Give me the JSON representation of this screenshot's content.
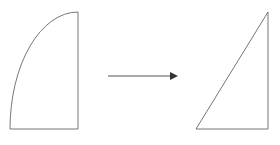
{
  "diagram": {
    "title": "Quarter ellipse region transformed into a right triangle",
    "background_color": "#ffffff",
    "stroke_color": "#777777",
    "arrow_color": "#444444",
    "canvas": {
      "width": 280,
      "height": 145
    }
  },
  "left_shape": {
    "name": "quarter-ellipse-region",
    "label": "",
    "description": "Region bounded by a concave-left elliptical arc, a vertical right edge and a horizontal bottom edge",
    "vertices": {
      "top_right": [
        78,
        12
      ],
      "bottom_right": [
        78,
        129
      ],
      "bottom_left": [
        10,
        129
      ]
    },
    "arc": {
      "type": "elliptical",
      "center": [
        78,
        129
      ],
      "rx": 68,
      "ry": 117,
      "from": [
        78,
        12
      ],
      "to": [
        10,
        129
      ],
      "sweep": "counterclockwise"
    },
    "path": "M 78 12 A 68 117 0 0 0 10 129 L 78 129 Z"
  },
  "right_shape": {
    "name": "right-triangle",
    "label": "",
    "description": "Right triangle with the right angle at the bottom-right corner",
    "vertices": {
      "apex_top_right": [
        268,
        12
      ],
      "bottom_right": [
        268,
        129
      ],
      "bottom_left": [
        196,
        129
      ]
    },
    "path": "M 268 12 L 268 129 L 196 129 Z"
  },
  "arrow": {
    "name": "transformation-arrow",
    "label": "",
    "direction": "right",
    "shaft": {
      "x1": 108,
      "y1": 76,
      "x2": 171,
      "y2": 76
    },
    "head": {
      "tip": [
        178,
        76
      ],
      "base_top": [
        170,
        72
      ],
      "base_bottom": [
        170,
        80
      ]
    }
  }
}
